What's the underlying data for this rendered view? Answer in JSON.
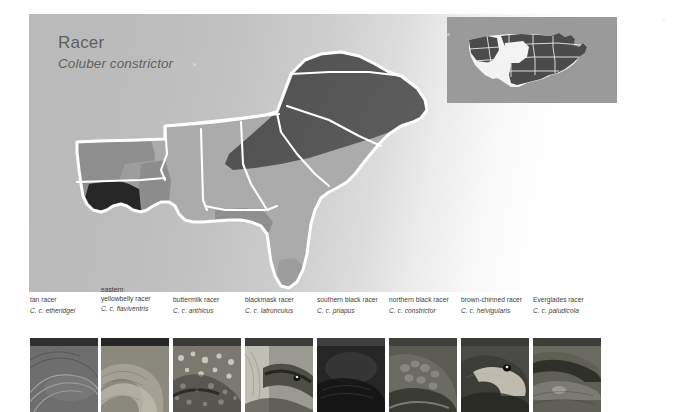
{
  "page": {
    "background": "#ffffff",
    "plate_gradient_from": "#b9b9b9",
    "plate_gradient_to": "#ffffff"
  },
  "heading": {
    "common_name": "Racer",
    "scientific_name": "Coluber constrictor"
  },
  "inset_map": {
    "name": "united-states-range-inset",
    "panel_color": "#9a9a9a",
    "land_color": "#f2f2f2",
    "range_color": "#4f4f4f",
    "border_color": "#ffffff",
    "description": "United States outline with species range shaded dark over most of the country except the far west interior"
  },
  "main_map": {
    "name": "southeastern-united-states-subspecies-range-map",
    "region": "Southeastern United States",
    "background": "transparent",
    "state_outline_color": "#ffffff",
    "legend_shades": [
      {
        "label": "tan racer",
        "color": "#2d2d2d"
      },
      {
        "label": "eastern yellowbelly racer",
        "color": "#8a8a8a"
      },
      {
        "label": "buttermilk racer",
        "color": "#a3a3a3"
      },
      {
        "label": "blackmask racer",
        "color": "#989898"
      },
      {
        "label": "southern black racer",
        "color": "#ababab"
      },
      {
        "label": "northern black racer",
        "color": "#5a5a5a"
      },
      {
        "label": "brown-chinned racer",
        "color": "#8f8f8f"
      },
      {
        "label": "Everglades racer",
        "color": "#a0a0a0"
      }
    ]
  },
  "subspecies": [
    {
      "id": "tan-racer",
      "common_pre": "",
      "common_name": "tan racer",
      "scientific_name": "C. c. etheridgei",
      "left": 1,
      "photo_tone": "#6f6f6f"
    },
    {
      "id": "eastern-yellowbelly-racer",
      "common_pre": "eastern",
      "common_name": "yellowbelly racer",
      "scientific_name": "C. c. flaviventris",
      "left": 72,
      "photo_tone": "#8d8a7e"
    },
    {
      "id": "buttermilk-racer",
      "common_pre": "",
      "common_name": "buttermilk racer",
      "scientific_name": "C. c. anthicus",
      "left": 144,
      "photo_tone": "#7d7a70"
    },
    {
      "id": "blackmask-racer",
      "common_pre": "",
      "common_name": "blackmask racer",
      "scientific_name": "C. c. latrunculus",
      "left": 216,
      "photo_tone": "#8f8f86"
    },
    {
      "id": "southern-black-racer",
      "common_pre": "",
      "common_name": "southern black racer",
      "scientific_name": "C. c. priapus",
      "left": 288,
      "photo_tone": "#3a3a3a"
    },
    {
      "id": "northern-black-racer",
      "common_pre": "",
      "common_name": "northern black racer",
      "scientific_name": "C. c. constrictor",
      "left": 360,
      "photo_tone": "#565650"
    },
    {
      "id": "brown-chinned-racer",
      "common_pre": "",
      "common_name": "brown-chinned racer",
      "scientific_name": "C. c. helvigularis",
      "left": 432,
      "photo_tone": "#4e4e4a"
    },
    {
      "id": "everglades-racer",
      "common_pre": "",
      "common_name": "Everglades racer",
      "scientific_name": "C. c. paludicola",
      "left": 504,
      "photo_tone": "#6b6b62"
    }
  ]
}
